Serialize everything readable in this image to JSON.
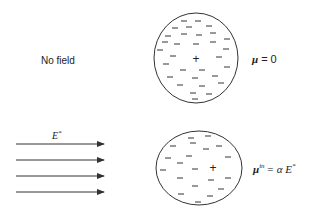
{
  "top_panel": {
    "label": "No field",
    "equation_symbol": "μ",
    "equation_rhs": "= 0",
    "center_charge": "+"
  },
  "bottom_panel": {
    "field_label": "E",
    "field_label_sup": "*",
    "equation_symbol": "μ",
    "equation_sup": "in",
    "equation_rhs": "= α E",
    "equation_rhs_sup": "*",
    "center_charge": "+",
    "arrow_count": 4
  },
  "colors": {
    "stroke": "#333333",
    "text": "#222222",
    "background": "#ffffff"
  }
}
